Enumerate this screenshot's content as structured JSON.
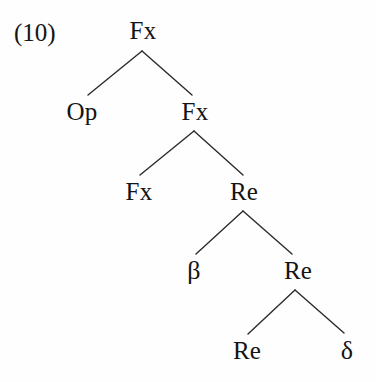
{
  "figure": {
    "label": "(10)",
    "label_x": 14,
    "label_y": 20,
    "background_color": "#fefefe",
    "ink_color": "#141414",
    "width": 376,
    "height": 382
  },
  "tree": {
    "description": "binary branching syntactic tree",
    "nodes": [
      {
        "id": "n0",
        "label": "Fx",
        "x": 143,
        "y": 18,
        "depth": 0,
        "role": "root"
      },
      {
        "id": "n1",
        "label": "Op",
        "x": 82,
        "y": 99,
        "depth": 1,
        "role": "leaf"
      },
      {
        "id": "n2",
        "label": "Fx",
        "x": 195,
        "y": 99,
        "depth": 1,
        "role": "internal"
      },
      {
        "id": "n3",
        "label": "Fx",
        "x": 139,
        "y": 179,
        "depth": 2,
        "role": "leaf"
      },
      {
        "id": "n4",
        "label": "Re",
        "x": 244,
        "y": 179,
        "depth": 2,
        "role": "internal"
      },
      {
        "id": "n5",
        "label": "β",
        "x": 194,
        "y": 258,
        "depth": 3,
        "role": "leaf"
      },
      {
        "id": "n6",
        "label": "Re",
        "x": 298,
        "y": 258,
        "depth": 3,
        "role": "internal"
      },
      {
        "id": "n7",
        "label": "Re",
        "x": 247,
        "y": 338,
        "depth": 4,
        "role": "leaf"
      },
      {
        "id": "n8",
        "label": "δ",
        "x": 347,
        "y": 338,
        "depth": 4,
        "role": "leaf"
      }
    ],
    "edges": [
      {
        "from": "n0",
        "to": "n1",
        "x1": 142,
        "y1": 51,
        "x2": 88,
        "y2": 95
      },
      {
        "from": "n0",
        "to": "n2",
        "x1": 142,
        "y1": 51,
        "x2": 192,
        "y2": 95
      },
      {
        "from": "n2",
        "to": "n3",
        "x1": 194,
        "y1": 131,
        "x2": 140,
        "y2": 175
      },
      {
        "from": "n2",
        "to": "n4",
        "x1": 194,
        "y1": 131,
        "x2": 243,
        "y2": 175
      },
      {
        "from": "n4",
        "to": "n5",
        "x1": 243,
        "y1": 211,
        "x2": 196,
        "y2": 254
      },
      {
        "from": "n4",
        "to": "n6",
        "x1": 243,
        "y1": 211,
        "x2": 292,
        "y2": 254
      },
      {
        "from": "n6",
        "to": "n7",
        "x1": 295,
        "y1": 290,
        "x2": 248,
        "y2": 334
      },
      {
        "from": "n6",
        "to": "n8",
        "x1": 295,
        "y1": 290,
        "x2": 344,
        "y2": 333
      }
    ],
    "edge_color": "#2b2b2b",
    "edge_width": 1.4
  }
}
